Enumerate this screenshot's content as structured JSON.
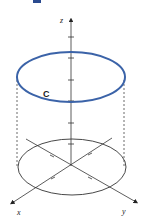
{
  "figure": {
    "type": "3D cylinder with curve C",
    "axes": {
      "x_label": "x",
      "y_label": "y",
      "z_label": "z"
    },
    "curve_label": "C",
    "colors": {
      "curve": "#3b63a8",
      "axes": "#333333",
      "base": "#333333",
      "marker": "#2a4a8f"
    }
  }
}
